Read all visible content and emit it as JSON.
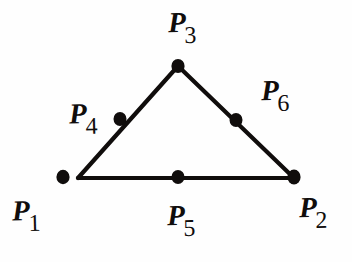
{
  "figure": {
    "kind": "geometry-diagram",
    "canvas": {
      "width": 352,
      "height": 262
    },
    "background_color": "#fefefe",
    "ink_color": "#100d0c",
    "stroke_width": 4.2,
    "node_radius": 6.4
  },
  "triangle": {
    "name": "element-triangle",
    "vertices": [
      {
        "id": "A",
        "x": 78,
        "y": 178
      },
      {
        "id": "B",
        "x": 294,
        "y": 178
      },
      {
        "id": "C",
        "x": 178,
        "y": 66
      }
    ],
    "edges": [
      {
        "id": "bottom",
        "from": "A",
        "to": "B"
      },
      {
        "id": "left",
        "from": "A",
        "to": "C"
      },
      {
        "id": "right",
        "from": "C",
        "to": "B"
      }
    ]
  },
  "nodes": [
    {
      "id": "P1",
      "label_base": "P",
      "label_sub": "1",
      "x": 63,
      "y": 177,
      "role": "corner-node",
      "edge": null
    },
    {
      "id": "P2",
      "label_base": "P",
      "label_sub": "2",
      "x": 294,
      "y": 177,
      "role": "corner-node",
      "edge": null
    },
    {
      "id": "P3",
      "label_base": "P",
      "label_sub": "3",
      "x": 178,
      "y": 66,
      "role": "corner-node",
      "edge": null
    },
    {
      "id": "P4",
      "label_base": "P",
      "label_sub": "4",
      "x": 120,
      "y": 119,
      "role": "midside-node",
      "edge": "left"
    },
    {
      "id": "P5",
      "label_base": "P",
      "label_sub": "5",
      "x": 178,
      "y": 177,
      "role": "midside-node",
      "edge": "bottom"
    },
    {
      "id": "P6",
      "label_base": "P",
      "label_sub": "6",
      "x": 236,
      "y": 120,
      "role": "midside-node",
      "edge": "right"
    }
  ],
  "labels": {
    "p1": {
      "base": "P",
      "sub": "1"
    },
    "p2": {
      "base": "P",
      "sub": "2"
    },
    "p3": {
      "base": "P",
      "sub": "3"
    },
    "p4": {
      "base": "P",
      "sub": "4"
    },
    "p5": {
      "base": "P",
      "sub": "5"
    },
    "p6": {
      "base": "P",
      "sub": "6"
    }
  }
}
